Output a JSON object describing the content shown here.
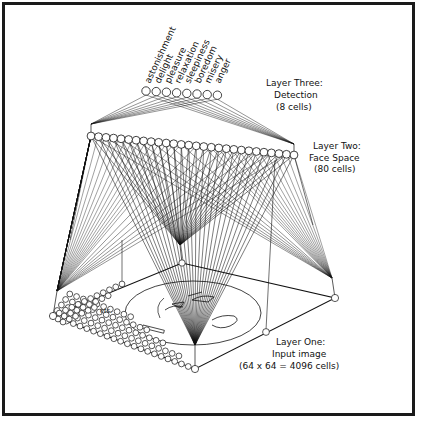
{
  "diagram": {
    "type": "three-layer neural network for facial expression recognition",
    "colors": {
      "ink": "#111111",
      "background": "#ffffff",
      "frame": "#1a1a1a"
    },
    "layer_three": {
      "title": "Layer Three:",
      "subtitle": "Detection",
      "count_label": "(8 cells)",
      "outputs": [
        "astonishment",
        "delight",
        "pleasure",
        "relaxation",
        "sleepiness",
        "boredom",
        "misery",
        "anger"
      ]
    },
    "layer_two": {
      "title": "Layer Two:",
      "subtitle": "Face Space",
      "count_label": "(80 cells)"
    },
    "layer_one": {
      "title": "Layer One:",
      "subtitle": "Input image",
      "count_label": "(64 x 64 = 4096 cells)",
      "etc_label": "etc."
    }
  }
}
